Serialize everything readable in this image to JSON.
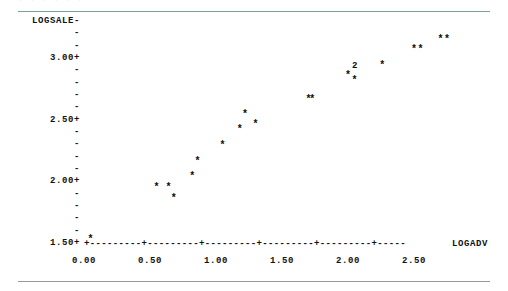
{
  "figure": {
    "top_clipped_text": "·        ·         ·     ·          ·      ·",
    "y_axis_title": "LOGSALE-",
    "x_axis_title": "LOGADV",
    "x_axis_line": "+---------+---------+---------+---------+---------+-----",
    "y_tick_dash": "-",
    "y_ticks": [
      {
        "label": "LOGSALE-",
        "value": null,
        "major": true
      },
      {
        "label": "-",
        "value": null,
        "major": false
      },
      {
        "label": "-",
        "value": null,
        "major": false
      },
      {
        "label": "3.00+",
        "value": 3.0,
        "major": true
      },
      {
        "label": "-",
        "value": null,
        "major": false
      },
      {
        "label": "-",
        "value": null,
        "major": false
      },
      {
        "label": "-",
        "value": null,
        "major": false
      },
      {
        "label": "-",
        "value": null,
        "major": false
      },
      {
        "label": "2.50+",
        "value": 2.5,
        "major": true
      },
      {
        "label": "-",
        "value": null,
        "major": false
      },
      {
        "label": "-",
        "value": null,
        "major": false
      },
      {
        "label": "-",
        "value": null,
        "major": false
      },
      {
        "label": "-",
        "value": null,
        "major": false
      },
      {
        "label": "2.00+",
        "value": 2.0,
        "major": true
      },
      {
        "label": "-",
        "value": null,
        "major": false
      },
      {
        "label": "-",
        "value": null,
        "major": false
      },
      {
        "label": "-",
        "value": null,
        "major": false
      },
      {
        "label": "-",
        "value": null,
        "major": false
      },
      {
        "label": "1.50+",
        "value": 1.5,
        "major": true
      }
    ],
    "x_ticks": [
      {
        "label": "0.00",
        "value": 0.0
      },
      {
        "label": "0.50",
        "value": 0.5
      },
      {
        "label": "1.00",
        "value": 1.0
      },
      {
        "label": "1.50",
        "value": 1.5
      },
      {
        "label": "2.00",
        "value": 2.0
      },
      {
        "label": "2.50",
        "value": 2.5
      }
    ]
  },
  "chart_data": {
    "type": "scatter",
    "title": "",
    "subtitle": "",
    "xlabel": "LOGADV",
    "ylabel": "LOGSALE",
    "xlim": [
      0.0,
      2.9
    ],
    "ylim": [
      1.44,
      3.32
    ],
    "grid": false,
    "legend": false,
    "marker_glyph": "*",
    "overplot_notation": "numeric count replaces * when points coincide",
    "annotations": [
      {
        "text": "2",
        "x": 2.05,
        "y": 3.03,
        "note": "two coincident observations"
      }
    ],
    "points": [
      {
        "x": 0.05,
        "y": 1.53,
        "glyph": "*",
        "count": 1
      },
      {
        "x": 0.55,
        "y": 1.97,
        "glyph": "*",
        "count": 1
      },
      {
        "x": 0.64,
        "y": 1.97,
        "glyph": "*",
        "count": 1
      },
      {
        "x": 0.68,
        "y": 1.88,
        "glyph": "*",
        "count": 1
      },
      {
        "x": 0.82,
        "y": 2.07,
        "glyph": "*",
        "count": 1
      },
      {
        "x": 0.86,
        "y": 2.2,
        "glyph": "*",
        "count": 1
      },
      {
        "x": 1.05,
        "y": 2.34,
        "glyph": "*",
        "count": 1
      },
      {
        "x": 1.18,
        "y": 2.47,
        "glyph": "*",
        "count": 1
      },
      {
        "x": 1.22,
        "y": 2.6,
        "glyph": "*",
        "count": 1
      },
      {
        "x": 1.3,
        "y": 2.52,
        "glyph": "*",
        "count": 1
      },
      {
        "x": 1.7,
        "y": 2.73,
        "glyph": "*",
        "count": 1
      },
      {
        "x": 1.73,
        "y": 2.73,
        "glyph": "*",
        "count": 1
      },
      {
        "x": 2.0,
        "y": 2.94,
        "glyph": "*",
        "count": 1
      },
      {
        "x": 2.05,
        "y": 3.03,
        "glyph": "2",
        "count": 2
      },
      {
        "x": 2.05,
        "y": 2.9,
        "glyph": "*",
        "count": 1
      },
      {
        "x": 2.26,
        "y": 3.03,
        "glyph": "*",
        "count": 1
      },
      {
        "x": 2.5,
        "y": 3.16,
        "glyph": "*",
        "count": 1
      },
      {
        "x": 2.55,
        "y": 3.16,
        "glyph": "*",
        "count": 1
      },
      {
        "x": 2.7,
        "y": 3.25,
        "glyph": "*",
        "count": 1
      },
      {
        "x": 2.75,
        "y": 3.25,
        "glyph": "*",
        "count": 1
      }
    ]
  }
}
